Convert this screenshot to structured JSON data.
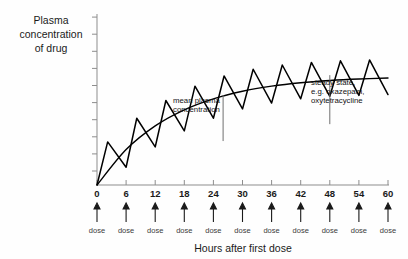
{
  "chart_data": {
    "type": "line",
    "title": "",
    "xlabel": "Hours after first dose",
    "ylabel": "Plasma concentration of drug",
    "ylabel_lines": [
      "Plasma",
      "concentration",
      "of drug"
    ],
    "xlim": [
      0,
      60
    ],
    "ylim": [
      0,
      10
    ],
    "xticks": [
      0,
      6,
      12,
      18,
      24,
      30,
      36,
      42,
      48,
      54,
      60
    ],
    "xtick_labels": [
      "0",
      "6",
      "12",
      "18",
      "24",
      "30",
      "36",
      "42",
      "48",
      "54",
      "60"
    ],
    "ytick_count": 10,
    "ytick_labels": [],
    "grid": false,
    "legend": "none",
    "series": [
      {
        "name": "plasma concentration (oscillating)",
        "color": "#000000",
        "description": "Sawtooth oscillation with one peak per 6-hour dosing interval, rising toward steady state",
        "x": [
          0,
          2.2,
          6,
          8.2,
          12,
          14.2,
          18,
          20.2,
          24,
          26.2,
          30,
          32.2,
          36,
          38.2,
          42,
          44.2,
          48,
          50.2,
          54,
          56.2,
          60
        ],
        "y": [
          0,
          2.55,
          1.05,
          3.95,
          2.25,
          5.0,
          3.2,
          5.85,
          3.95,
          6.45,
          4.5,
          6.85,
          4.85,
          7.1,
          5.1,
          7.25,
          5.25,
          7.35,
          5.3,
          7.4,
          5.35
        ]
      },
      {
        "name": "mean plasma concentration",
        "color": "#000000",
        "description": "Smooth exponential approach to steady state plateau",
        "x": [
          0,
          6,
          12,
          18,
          24,
          30,
          36,
          42,
          48,
          54,
          60
        ],
        "y": [
          0,
          2.1,
          3.5,
          4.45,
          5.1,
          5.55,
          5.85,
          6.05,
          6.18,
          6.27,
          6.33
        ]
      }
    ],
    "annotations": [
      {
        "name": "mean-plasma-concentration",
        "lines": [
          "mean plasma",
          "concentration"
        ],
        "x": 26,
        "leader_from_y": 5.3,
        "leader_to_y": 2.6
      },
      {
        "name": "steady-state",
        "lines": [
          "steady state,",
          "e.g. oxazepam,",
          "oxytetracycline"
        ],
        "x": 48,
        "leader_from_y": 6.5,
        "leader_to_y": 3.6
      }
    ],
    "dose_markers": {
      "label": "dose",
      "count": 11,
      "hours": [
        0,
        6,
        12,
        18,
        24,
        30,
        36,
        42,
        48,
        54,
        60
      ],
      "labels": [
        "dose",
        "dose",
        "dose",
        "dose",
        "dose",
        "dose",
        "dose",
        "dose",
        "dose",
        "dose",
        "dose"
      ],
      "arrow_direction": "up"
    },
    "colors": {
      "background": "#fefefe",
      "curve": "#000000",
      "axis": "#8d8d8d",
      "text": "#1a1a1a",
      "leader": "#6f6f6f"
    }
  }
}
